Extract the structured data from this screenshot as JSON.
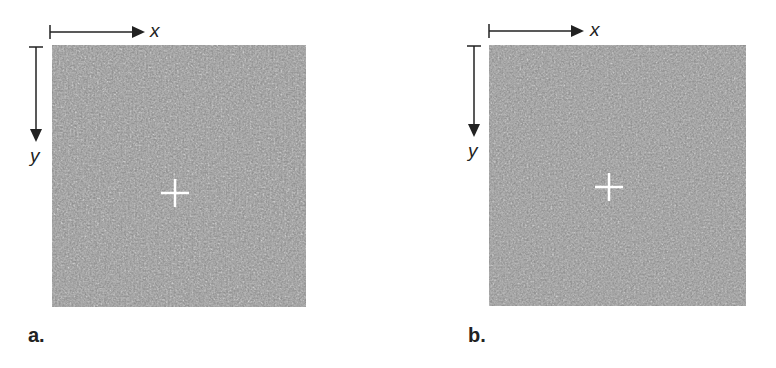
{
  "figure": {
    "panels": [
      {
        "id": "a",
        "label": "a.",
        "x_axis_label": "x",
        "y_axis_label": "y",
        "image_description": "grayscale speckle pattern with white crosshair marker"
      },
      {
        "id": "b",
        "label": "b.",
        "x_axis_label": "x",
        "y_axis_label": "y",
        "image_description": "grayscale speckle pattern with white crosshair marker, shifted"
      }
    ]
  },
  "colors": {
    "speckle_base": "#4a4a4a",
    "axis": "#222222",
    "crosshair": "#ffffff"
  }
}
